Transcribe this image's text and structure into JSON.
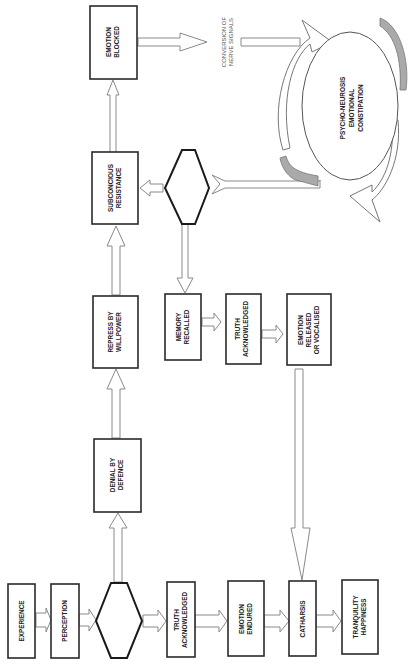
{
  "diagram": {
    "nodes": {
      "experience": [
        "EXPERIENCE"
      ],
      "perception": [
        "PERCEPTION"
      ],
      "truth_ack_1": [
        "TRUTH",
        "ACKNOWLEDGED"
      ],
      "emotion_endured": [
        "EMOTION",
        "ENDURED"
      ],
      "catharsis": [
        "CATHARSIS"
      ],
      "tranquility": [
        "TRANQUILITY",
        "HAPPINESS"
      ],
      "denial": [
        "DENIAL BY",
        "DEFENCE"
      ],
      "repress": [
        "REPRESS BY",
        "WILLPOWER"
      ],
      "subconscious": [
        "SUBCONCIOUS",
        "RESISTANCE"
      ],
      "emotion_blocked": [
        "EMOTION",
        "BLOCKED"
      ],
      "memory_recalled": [
        "MEMORY",
        "RECALLED"
      ],
      "truth_ack_2": [
        "TRUTH",
        "ACKNOWLEDGED"
      ],
      "emotion_released": [
        "EMOTION",
        "RELEASED",
        "OR VOCALISED"
      ],
      "psycho_neurosis": [
        "PSYCHO-NEUROSIS",
        "EMOTIONAL",
        "CONSTIPATION"
      ]
    },
    "annotations": {
      "conversion": [
        "CONVERSION OF",
        "NERVE SIGNALS"
      ]
    },
    "decisions": [
      "decision-1",
      "decision-2"
    ]
  }
}
